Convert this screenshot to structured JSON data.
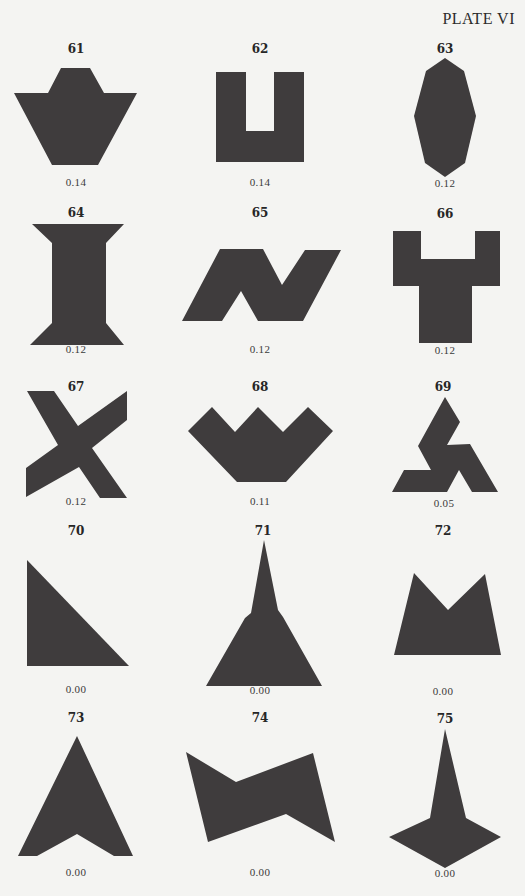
{
  "plate": {
    "title": "PLATE VI"
  },
  "colors": {
    "shape_fill": "#3f3c3d",
    "background": "#f4f4f2"
  },
  "figures": [
    {
      "number": "61",
      "value": "0.14"
    },
    {
      "number": "62",
      "value": "0.14"
    },
    {
      "number": "63",
      "value": "0.12"
    },
    {
      "number": "64",
      "value": "0.12"
    },
    {
      "number": "65",
      "value": "0.12"
    },
    {
      "number": "66",
      "value": "0.12"
    },
    {
      "number": "67",
      "value": "0.12"
    },
    {
      "number": "68",
      "value": "0.11"
    },
    {
      "number": "69",
      "value": "0.05"
    },
    {
      "number": "70",
      "value": "0.00"
    },
    {
      "number": "71",
      "value": "0.00"
    },
    {
      "number": "72",
      "value": "0.00"
    },
    {
      "number": "73",
      "value": "0.00"
    },
    {
      "number": "74",
      "value": "0.00"
    },
    {
      "number": "75",
      "value": "0.00"
    }
  ]
}
